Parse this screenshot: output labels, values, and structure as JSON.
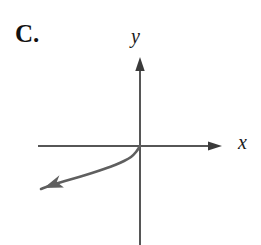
{
  "figure": {
    "label": "C.",
    "background_color": "#ffffff",
    "stroke_color": "#5f5f5f",
    "axis_color": "#565656",
    "text_color": "#111111"
  },
  "axes": {
    "x_label": "x",
    "y_label": "y",
    "x_axis_name": "horizontal-axis",
    "y_axis_name": "vertical-axis",
    "origin": {
      "x": 140,
      "y": 146
    },
    "x_start": {
      "x": 38,
      "y": 146
    },
    "x_end": {
      "x": 222,
      "y": 146
    },
    "y_start": {
      "x": 140,
      "y": 245
    },
    "y_end": {
      "x": 140,
      "y": 58
    },
    "x_arrow": "arrow-right",
    "y_arrow": "arrow-up"
  },
  "chart_data": {
    "type": "line",
    "title": "C.",
    "xlabel": "x",
    "ylabel": "y",
    "grid": false,
    "legend": null,
    "series": [
      {
        "name": "curve",
        "arrow_end": "left",
        "points_px": [
          [
            140,
            146
          ],
          [
            136,
            152
          ],
          [
            131,
            157
          ],
          [
            124,
            161
          ],
          [
            115,
            165
          ],
          [
            104,
            169
          ],
          [
            92,
            173
          ],
          [
            79,
            177
          ],
          [
            65,
            181
          ],
          [
            52,
            185
          ],
          [
            41,
            189
          ]
        ]
      }
    ],
    "axis_ranges": {
      "xlim": [
        -5,
        3
      ],
      "ylim": [
        -3,
        3
      ]
    }
  },
  "icons": {
    "x_axis_arrow": "arrow-right-icon",
    "y_axis_arrow": "arrow-up-icon",
    "curve_arrow": "arrow-left-icon"
  }
}
